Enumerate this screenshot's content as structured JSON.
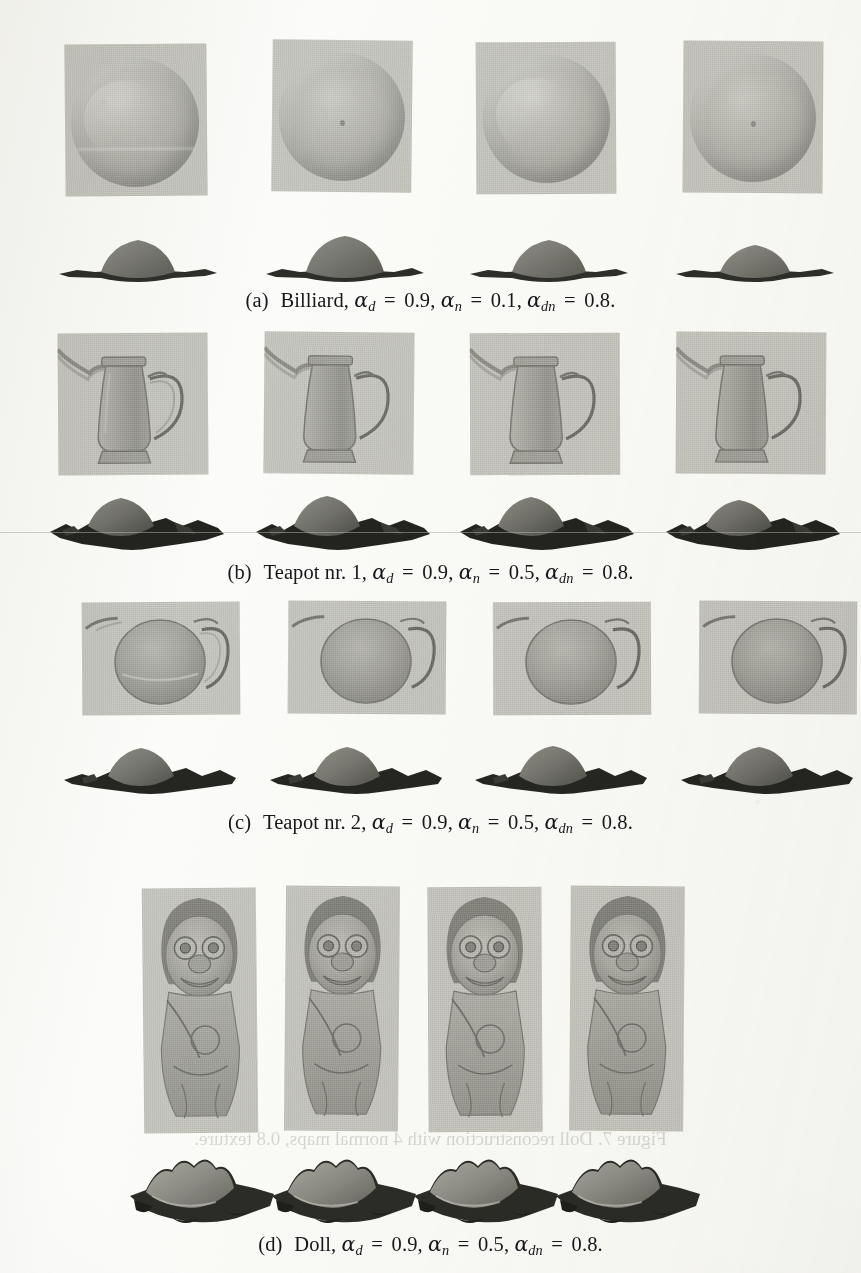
{
  "page": {
    "kind": "scanned-paper-figure-page",
    "width": 861,
    "height": 1273,
    "background_color": "#fbfbf9",
    "ink_color": "#17171b"
  },
  "subfigures": [
    {
      "id": "a",
      "tag": "(a)",
      "object_label": "Billiard,",
      "params": [
        {
          "symbol": "α",
          "sub": "d",
          "eq": "=",
          "value": "0.9",
          "sep": ","
        },
        {
          "symbol": "α",
          "sub": "n",
          "eq": "=",
          "value": "0.1",
          "sep": ","
        },
        {
          "symbol": "α",
          "sub": "dn",
          "eq": "=",
          "value": "0.8",
          "sep": "."
        }
      ],
      "caption_plain": "(a) Billiard, αd = 0.9, αn = 0.1, αdn = 0.8.",
      "image_columns": 4,
      "surface_columns": 4
    },
    {
      "id": "b",
      "tag": "(b)",
      "object_label": "Teapot nr. 1,",
      "params": [
        {
          "symbol": "α",
          "sub": "d",
          "eq": "=",
          "value": "0.9",
          "sep": ","
        },
        {
          "symbol": "α",
          "sub": "n",
          "eq": "=",
          "value": "0.5",
          "sep": ","
        },
        {
          "symbol": "α",
          "sub": "dn",
          "eq": "=",
          "value": "0.8",
          "sep": "."
        }
      ],
      "caption_plain": "(b) Teapot nr. 1, αd = 0.9, αn = 0.5, αdn = 0.8.",
      "image_columns": 4,
      "surface_columns": 4
    },
    {
      "id": "c",
      "tag": "(c)",
      "object_label": "Teapot nr. 2,",
      "params": [
        {
          "symbol": "α",
          "sub": "d",
          "eq": "=",
          "value": "0.9",
          "sep": ","
        },
        {
          "symbol": "α",
          "sub": "n",
          "eq": "=",
          "value": "0.5",
          "sep": ","
        },
        {
          "symbol": "α",
          "sub": "dn",
          "eq": "=",
          "value": "0.8",
          "sep": "."
        }
      ],
      "caption_plain": "(c) Teapot nr. 2, αd = 0.9, αn = 0.5, αdn = 0.8.",
      "image_columns": 4,
      "surface_columns": 4
    },
    {
      "id": "d",
      "tag": "(d)",
      "object_label": "Doll,",
      "params": [
        {
          "symbol": "α",
          "sub": "d",
          "eq": "=",
          "value": "0.9",
          "sep": ","
        },
        {
          "symbol": "α",
          "sub": "n",
          "eq": "=",
          "value": "0.5",
          "sep": ","
        },
        {
          "symbol": "α",
          "sub": "dn",
          "eq": "=",
          "value": "0.8",
          "sep": "."
        }
      ],
      "caption_plain": "(d) Doll, αd = 0.9, αn = 0.5, αdn = 0.8.",
      "image_columns": 4,
      "surface_columns": 4
    }
  ],
  "bleed_through": {
    "line_1": "Figure 7. Doll reconstruction with 4 normal maps, 0.8 texture.",
    "line_2": "A 9.0 = b.a , 2.0 = n.a , 9.0 = d.a  noitcurtsnocer"
  }
}
